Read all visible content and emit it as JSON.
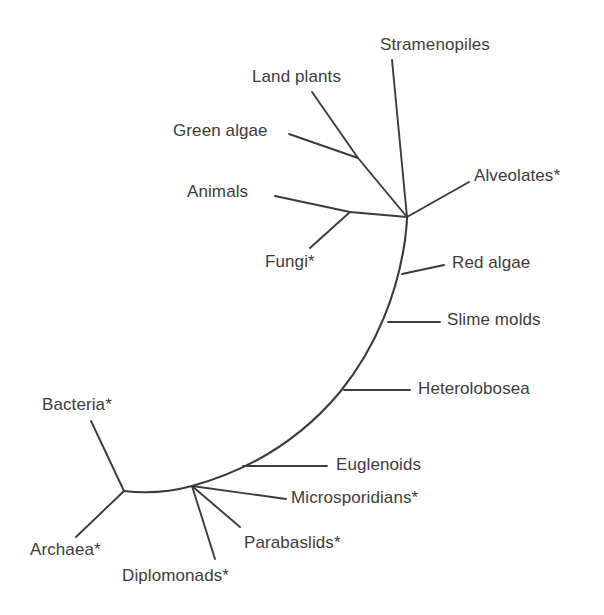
{
  "figure": {
    "type": "unrooted-phylogenetic-tree",
    "background_color": "#ffffff",
    "line_color": "#3b3b3b",
    "text_color": "#3c3c3c",
    "asterisk_note_marker": "*",
    "width": 604,
    "height": 615
  },
  "nodes": {
    "root": {
      "name": "root-trifurcation",
      "x": 124,
      "y": 491
    },
    "eukaryote_hub": {
      "name": "eukaryote-crown-hub",
      "x": 407,
      "y": 217
    },
    "plant_fork": {
      "name": "green-algae-land-plants-fork",
      "x": 358,
      "y": 158
    },
    "opisthokont_fork": {
      "name": "animals-fungi-fork",
      "x": 350,
      "y": 212
    },
    "red_algae_base": {
      "name": "red-algae-base",
      "x": 402,
      "y": 274
    },
    "slime_molds_base": {
      "name": "slime-molds-base",
      "x": 388,
      "y": 322
    },
    "heterolobosea_base": {
      "name": "heterolobosea-base",
      "x": 344,
      "y": 390
    },
    "euglenoids_base": {
      "name": "euglenoids-base",
      "x": 243,
      "y": 466
    },
    "excavate_fork": {
      "name": "diplomonads-parabaslids-fork",
      "x": 192,
      "y": 486
    }
  },
  "taxa": [
    {
      "id": "stramenopiles",
      "label": "Stramenopiles",
      "label_x": 380,
      "label_y": 36,
      "tip_x": 392,
      "tip_y": 60,
      "starred": false
    },
    {
      "id": "land-plants",
      "label": "Land plants",
      "label_x": 252,
      "label_y": 68,
      "tip_x": 312,
      "tip_y": 92,
      "starred": false
    },
    {
      "id": "green-algae",
      "label": "Green algae",
      "label_x": 173,
      "label_y": 122,
      "tip_x": 289,
      "tip_y": 134,
      "starred": false
    },
    {
      "id": "alveolates",
      "label": "Alveolates*",
      "label_x": 474,
      "label_y": 167,
      "tip_x": 469,
      "tip_y": 182,
      "starred": true
    },
    {
      "id": "animals",
      "label": "Animals",
      "label_x": 187,
      "label_y": 183,
      "tip_x": 275,
      "tip_y": 196,
      "starred": false
    },
    {
      "id": "fungi",
      "label": "Fungi*",
      "label_x": 265,
      "label_y": 253,
      "tip_x": 310,
      "tip_y": 248,
      "starred": true
    },
    {
      "id": "red-algae",
      "label": "Red algae",
      "label_x": 452,
      "label_y": 254,
      "tip_x": 444,
      "tip_y": 265,
      "starred": false
    },
    {
      "id": "slime-molds",
      "label": "Slime molds",
      "label_x": 447,
      "label_y": 311,
      "tip_x": 440,
      "tip_y": 322,
      "starred": false
    },
    {
      "id": "heterolobosea",
      "label": "Heterolobosea",
      "label_x": 418,
      "label_y": 380,
      "tip_x": 410,
      "tip_y": 390,
      "starred": false
    },
    {
      "id": "euglenoids",
      "label": "Euglenoids",
      "label_x": 336,
      "label_y": 456,
      "tip_x": 327,
      "tip_y": 466,
      "starred": false
    },
    {
      "id": "microsporidians",
      "label": "Microsporidians*",
      "label_x": 291,
      "label_y": 489,
      "tip_x": 286,
      "tip_y": 499,
      "starred": true
    },
    {
      "id": "parabaslids",
      "label": "Parabaslids*",
      "label_x": 244,
      "label_y": 534,
      "tip_x": 240,
      "tip_y": 527,
      "starred": true
    },
    {
      "id": "diplomonads",
      "label": "Diplomonads*",
      "label_x": 122,
      "label_y": 567,
      "tip_x": 215,
      "tip_y": 559,
      "starred": true
    },
    {
      "id": "bacteria",
      "label": "Bacteria*",
      "label_x": 42,
      "label_y": 396,
      "tip_x": 91,
      "tip_y": 421,
      "starred": true
    },
    {
      "id": "archaea",
      "label": "Archaea*",
      "label_x": 30,
      "label_y": 541,
      "tip_x": 76,
      "tip_y": 537,
      "starred": true
    }
  ],
  "branches": [
    {
      "id": "stramenopiles-branch",
      "from": "eukaryote_hub",
      "to_tip": "stramenopiles"
    },
    {
      "id": "alveolates-branch",
      "from": "eukaryote_hub",
      "to_tip": "alveolates"
    },
    {
      "id": "plant-stem",
      "from": "eukaryote_hub",
      "to_node": "plant_fork"
    },
    {
      "id": "land-plants-branch",
      "from": "plant_fork",
      "to_tip": "land-plants"
    },
    {
      "id": "green-algae-branch",
      "from": "plant_fork",
      "to_tip": "green-algae"
    },
    {
      "id": "opisthokont-stem",
      "from": "eukaryote_hub",
      "to_node": "opisthokont_fork"
    },
    {
      "id": "animals-branch",
      "from": "opisthokont_fork",
      "to_tip": "animals"
    },
    {
      "id": "fungi-branch",
      "from": "opisthokont_fork",
      "to_tip": "fungi"
    },
    {
      "id": "red-algae-branch",
      "from": "red_algae_base",
      "to_tip": "red-algae"
    },
    {
      "id": "slime-molds-branch",
      "from": "slime_molds_base",
      "to_tip": "slime-molds"
    },
    {
      "id": "heterolobosea-branch",
      "from": "heterolobosea_base",
      "to_tip": "heterolobosea"
    },
    {
      "id": "euglenoids-branch",
      "from": "euglenoids_base",
      "to_tip": "euglenoids"
    },
    {
      "id": "microsporidians-branch",
      "from": "excavate_fork",
      "to_tip": "microsporidians"
    },
    {
      "id": "parabaslids-branch",
      "from": "excavate_fork",
      "to_tip": "parabaslids"
    },
    {
      "id": "diplomonads-branch",
      "from": "excavate_fork",
      "to_tip": "diplomonads"
    },
    {
      "id": "bacteria-branch",
      "from": "root",
      "to_tip": "bacteria"
    },
    {
      "id": "archaea-branch",
      "from": "root",
      "to_tip": "archaea"
    },
    {
      "id": "root-to-eukaryotes-arc",
      "from": "root",
      "to_node": "eukaryote_hub",
      "curved": true
    }
  ],
  "arc_path": "M 124 491 C 150 494 170 492 192 486 C 250 470 300 440 340 392 C 378 345 398 290 405 240 C 406 231 407 224 407 217"
}
